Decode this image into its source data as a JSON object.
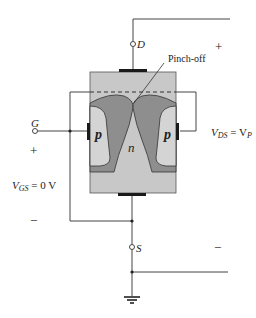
{
  "diagram": {
    "labels": {
      "drain": "D",
      "gate": "G",
      "source": "S",
      "pinch_off": "Pinch-off",
      "n_channel": "n",
      "p_left": "p",
      "p_right": "p",
      "vgs_v": "V",
      "vgs_sub": "GS",
      "vgs_rest": " = 0 V",
      "vds_v": "V",
      "vds_sub": "DS",
      "vds_eq": " = V",
      "vds_p_sub": "P",
      "plus_left": "+",
      "minus_left": "−",
      "plus_right": "+",
      "minus_right": "−"
    },
    "colors": {
      "channel": "#c8c8c8",
      "depletion": "#8e8e8e",
      "p_region": "#d4d4d4",
      "contact": "#1a1a1a",
      "wire": "#444444"
    }
  }
}
